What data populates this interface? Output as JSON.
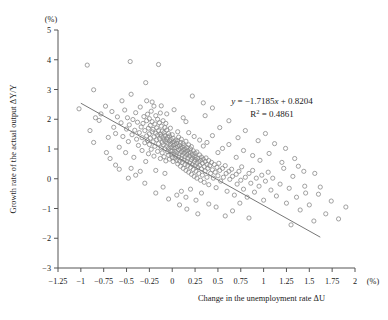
{
  "chart_data": {
    "type": "scatter",
    "title": "",
    "xlabel": "Change in the unemployment rate ΔU",
    "ylabel": "Growth rate of the actual output ΔY/Y",
    "x_unit": "(%)",
    "y_unit": "(%)",
    "xlim": [
      -1.25,
      2
    ],
    "ylim": [
      -3,
      5
    ],
    "x_ticks": [
      -1.25,
      -1,
      -0.75,
      -0.5,
      -0.25,
      0,
      0.25,
      0.5,
      0.75,
      1,
      1.25,
      1.5,
      1.75,
      2
    ],
    "x_tick_labels": [
      "−1.25",
      "−1",
      "−0.75",
      "−0.5",
      "−0.25",
      "0",
      "0.25",
      "0.5",
      "0.75",
      "1",
      "1.25",
      "1.5",
      "1.75",
      "2"
    ],
    "y_ticks": [
      -3,
      -2,
      -1,
      0,
      1,
      2,
      3,
      4,
      5
    ],
    "y_tick_labels": [
      "−3",
      "−2",
      "−1",
      "0",
      "1",
      "2",
      "3",
      "4",
      "5"
    ],
    "grid": false,
    "legend": "none",
    "marker": "open-circle",
    "marker_color": "#8a8a8a",
    "trendline": {
      "label": "y = −1.7185x + 0.8204",
      "r2_label": "R² = 0.4861",
      "slope": -1.7185,
      "intercept": 0.8204,
      "r_squared": 0.4861,
      "x_start": -1.0,
      "x_end": 1.62,
      "color": "#777777"
    },
    "annotations": [
      {
        "text_parts": {
          "lead": "y",
          "eq": " = −1.7185",
          "xvar": "x",
          "tail": " + 0.8204"
        },
        "x_px": 272,
        "y_px": 104
      },
      {
        "text_parts": {
          "base": "R",
          "sup": "2",
          "tail": " = 0.4861"
        },
        "x_px": 272,
        "y_px": 117
      }
    ],
    "points": [
      [
        -1.02,
        2.35
      ],
      [
        -0.93,
        3.82
      ],
      [
        -0.86,
        2.99
      ],
      [
        -0.84,
        2.05
      ],
      [
        -0.8,
        1.96
      ],
      [
        -0.78,
        2.18
      ],
      [
        -0.73,
        2.44
      ],
      [
        -0.7,
        1.39
      ],
      [
        -0.66,
        2.26
      ],
      [
        -0.64,
        1.73
      ],
      [
        -0.62,
        1.52
      ],
      [
        -0.6,
        2.08
      ],
      [
        -0.58,
        1.06
      ],
      [
        -0.56,
        1.88
      ],
      [
        -0.55,
        2.62
      ],
      [
        -0.54,
        1.42
      ],
      [
        -0.52,
        2.31
      ],
      [
        -0.51,
        0.88
      ],
      [
        -0.5,
        1.67
      ],
      [
        -0.49,
        2.05
      ],
      [
        -0.48,
        1.25
      ],
      [
        -0.47,
        1.81
      ],
      [
        -0.46,
        3.94
      ],
      [
        -0.45,
        2.84
      ],
      [
        -0.44,
        1.48
      ],
      [
        -0.43,
        1.99
      ],
      [
        -0.42,
        0.72
      ],
      [
        -0.41,
        1.63
      ],
      [
        -0.4,
        2.22
      ],
      [
        -0.39,
        1.33
      ],
      [
        -0.38,
        1.9
      ],
      [
        -0.37,
        1.12
      ],
      [
        -0.36,
        1.55
      ],
      [
        -0.35,
        2.41
      ],
      [
        -0.34,
        1.74
      ],
      [
        -0.33,
        0.95
      ],
      [
        -0.33,
        1.38
      ],
      [
        -0.32,
        1.86
      ],
      [
        -0.31,
        2.09
      ],
      [
        -0.3,
        1.21
      ],
      [
        -0.3,
        1.62
      ],
      [
        -0.29,
        3.23
      ],
      [
        -0.29,
        0.58
      ],
      [
        -0.28,
        1.44
      ],
      [
        -0.28,
        1.95
      ],
      [
        -0.27,
        1.28
      ],
      [
        -0.27,
        2.17
      ],
      [
        -0.26,
        1.7
      ],
      [
        -0.26,
        0.84
      ],
      [
        -0.25,
        1.51
      ],
      [
        -0.25,
        2.02
      ],
      [
        -0.25,
        1.15
      ],
      [
        -0.24,
        1.79
      ],
      [
        -0.24,
        1.36
      ],
      [
        -0.23,
        2.27
      ],
      [
        -0.23,
        0.99
      ],
      [
        -0.22,
        1.58
      ],
      [
        -0.22,
        1.92
      ],
      [
        -0.21,
        1.24
      ],
      [
        -0.21,
        1.66
      ],
      [
        -0.2,
        2.44
      ],
      [
        -0.2,
        0.76
      ],
      [
        -0.2,
        1.41
      ],
      [
        -0.19,
        1.84
      ],
      [
        -0.19,
        1.09
      ],
      [
        -0.18,
        1.53
      ],
      [
        -0.18,
        2.12
      ],
      [
        -0.17,
        1.31
      ],
      [
        -0.17,
        1.71
      ],
      [
        -0.16,
        0.92
      ],
      [
        -0.16,
        1.47
      ],
      [
        -0.16,
        2.0
      ],
      [
        -0.15,
        1.18
      ],
      [
        -0.15,
        1.62
      ],
      [
        -0.15,
        3.84
      ],
      [
        -0.14,
        1.35
      ],
      [
        -0.14,
        1.88
      ],
      [
        -0.13,
        0.68
      ],
      [
        -0.13,
        1.5
      ],
      [
        -0.13,
        2.21
      ],
      [
        -0.12,
        1.04
      ],
      [
        -0.12,
        1.43
      ],
      [
        -0.12,
        1.77
      ],
      [
        -0.11,
        1.22
      ],
      [
        -0.11,
        1.6
      ],
      [
        -0.11,
        0.87
      ],
      [
        -0.1,
        1.38
      ],
      [
        -0.1,
        1.95
      ],
      [
        -0.1,
        1.14
      ],
      [
        -0.09,
        1.55
      ],
      [
        -0.09,
        0.74
      ],
      [
        -0.09,
        1.3
      ],
      [
        -0.08,
        1.72
      ],
      [
        -0.08,
        1.01
      ],
      [
        -0.08,
        1.45
      ],
      [
        -0.07,
        1.25
      ],
      [
        -0.07,
        1.86
      ],
      [
        -0.07,
        0.6
      ],
      [
        -0.06,
        1.33
      ],
      [
        -0.06,
        1.08
      ],
      [
        -0.06,
        1.64
      ],
      [
        -0.05,
        0.91
      ],
      [
        -0.05,
        1.4
      ],
      [
        -0.05,
        1.19
      ],
      [
        -0.04,
        0.79
      ],
      [
        -0.04,
        1.52
      ],
      [
        -0.04,
        1.02
      ],
      [
        -0.03,
        1.27
      ],
      [
        -0.03,
        0.66
      ],
      [
        -0.03,
        1.44
      ],
      [
        -0.02,
        0.95
      ],
      [
        -0.02,
        1.16
      ],
      [
        -0.02,
        1.7
      ],
      [
        -0.01,
        0.82
      ],
      [
        -0.01,
        1.31
      ],
      [
        -0.01,
        1.05
      ],
      [
        0.0,
        0.71
      ],
      [
        0.0,
        1.22
      ],
      [
        0.0,
        1.48
      ],
      [
        0.0,
        0.93
      ],
      [
        0.01,
        1.12
      ],
      [
        0.01,
        0.58
      ],
      [
        0.01,
        1.36
      ],
      [
        0.02,
        0.84
      ],
      [
        0.02,
        1.03
      ],
      [
        0.02,
        1.25
      ],
      [
        0.03,
        0.69
      ],
      [
        0.03,
        1.15
      ],
      [
        0.03,
        0.92
      ],
      [
        0.04,
        1.3
      ],
      [
        0.04,
        0.77
      ],
      [
        0.04,
        1.05
      ],
      [
        0.05,
        0.62
      ],
      [
        0.05,
        1.19
      ],
      [
        0.05,
        0.88
      ],
      [
        0.06,
        1.08
      ],
      [
        0.06,
        0.5
      ],
      [
        0.06,
        1.27
      ],
      [
        0.07,
        0.73
      ],
      [
        0.07,
        0.97
      ],
      [
        0.07,
        1.4
      ],
      [
        0.08,
        0.59
      ],
      [
        0.08,
        1.12
      ],
      [
        0.08,
        0.84
      ],
      [
        0.09,
        1.02
      ],
      [
        0.09,
        0.42
      ],
      [
        0.09,
        1.22
      ],
      [
        0.1,
        0.68
      ],
      [
        0.1,
        0.91
      ],
      [
        0.1,
        1.33
      ],
      [
        0.11,
        0.55
      ],
      [
        0.11,
        1.06
      ],
      [
        0.11,
        0.79
      ],
      [
        0.12,
        0.97
      ],
      [
        0.12,
        0.35
      ],
      [
        0.12,
        1.18
      ],
      [
        0.13,
        0.63
      ],
      [
        0.13,
        0.86
      ],
      [
        0.13,
        1.11
      ],
      [
        0.14,
        0.48
      ],
      [
        0.14,
        1.0
      ],
      [
        0.14,
        0.74
      ],
      [
        0.15,
        0.92
      ],
      [
        0.15,
        1.26
      ],
      [
        0.15,
        0.28
      ],
      [
        0.16,
        0.58
      ],
      [
        0.16,
        0.81
      ],
      [
        0.16,
        1.05
      ],
      [
        0.17,
        0.44
      ],
      [
        0.17,
        0.95
      ],
      [
        0.17,
        0.69
      ],
      [
        0.18,
        0.86
      ],
      [
        0.18,
        0.22
      ],
      [
        0.18,
        1.14
      ],
      [
        0.19,
        0.53
      ],
      [
        0.19,
        0.76
      ],
      [
        0.2,
        1.0
      ],
      [
        0.2,
        0.38
      ],
      [
        0.2,
        0.89
      ],
      [
        0.21,
        0.64
      ],
      [
        0.21,
        0.15
      ],
      [
        0.21,
        1.08
      ],
      [
        0.22,
        0.48
      ],
      [
        0.22,
        0.81
      ],
      [
        0.22,
        0.7
      ],
      [
        0.23,
        0.31
      ],
      [
        0.23,
        0.94
      ],
      [
        0.24,
        0.58
      ],
      [
        0.24,
        0.76
      ],
      [
        0.24,
        0.08
      ],
      [
        0.25,
        0.44
      ],
      [
        0.25,
        0.86
      ],
      [
        0.25,
        0.65
      ],
      [
        0.26,
        0.25
      ],
      [
        0.26,
        0.72
      ],
      [
        0.27,
        0.52
      ],
      [
        0.27,
        0.02
      ],
      [
        0.27,
        0.9
      ],
      [
        0.28,
        0.38
      ],
      [
        0.28,
        0.68
      ],
      [
        0.29,
        0.58
      ],
      [
        0.29,
        0.18
      ],
      [
        0.3,
        0.8
      ],
      [
        0.3,
        0.45
      ],
      [
        0.31,
        0.62
      ],
      [
        0.31,
        -0.05
      ],
      [
        0.32,
        0.33
      ],
      [
        0.32,
        0.73
      ],
      [
        0.33,
        0.52
      ],
      [
        0.33,
        0.12
      ],
      [
        0.34,
        0.66
      ],
      [
        0.35,
        0.41
      ],
      [
        0.35,
        -0.12
      ],
      [
        0.36,
        0.58
      ],
      [
        0.36,
        0.26
      ],
      [
        0.37,
        0.7
      ],
      [
        0.38,
        0.48
      ],
      [
        0.38,
        0.05
      ],
      [
        0.39,
        0.35
      ],
      [
        0.4,
        0.61
      ],
      [
        0.4,
        -0.2
      ],
      [
        0.41,
        0.44
      ],
      [
        0.42,
        0.18
      ],
      [
        0.43,
        0.55
      ],
      [
        0.44,
        0.3
      ],
      [
        0.45,
        0.02
      ],
      [
        0.46,
        0.48
      ],
      [
        0.47,
        0.22
      ],
      [
        0.48,
        -0.3
      ],
      [
        0.49,
        0.38
      ],
      [
        0.5,
        0.1
      ],
      [
        0.51,
        0.52
      ],
      [
        0.52,
        0.28
      ],
      [
        0.53,
        -0.08
      ],
      [
        0.55,
        0.35
      ],
      [
        0.56,
        0.05
      ],
      [
        0.58,
        0.44
      ],
      [
        0.59,
        0.18
      ],
      [
        0.6,
        -0.42
      ],
      [
        0.62,
        0.25
      ],
      [
        0.63,
        -0.02
      ],
      [
        0.65,
        0.32
      ],
      [
        0.66,
        0.08
      ],
      [
        0.68,
        -0.55
      ],
      [
        0.7,
        0.15
      ],
      [
        0.71,
        -0.18
      ],
      [
        0.73,
        0.25
      ],
      [
        0.75,
        -0.05
      ],
      [
        0.76,
        0.4
      ],
      [
        0.78,
        -0.35
      ],
      [
        0.8,
        0.05
      ],
      [
        0.82,
        -0.62
      ],
      [
        0.84,
        0.18
      ],
      [
        0.86,
        -0.15
      ],
      [
        0.88,
        0.28
      ],
      [
        0.9,
        -0.45
      ],
      [
        0.92,
        0.02
      ],
      [
        0.95,
        -0.25
      ],
      [
        0.98,
        0.12
      ],
      [
        1.0,
        -0.72
      ],
      [
        1.02,
        -0.08
      ],
      [
        1.05,
        0.22
      ],
      [
        1.08,
        -0.38
      ],
      [
        1.1,
        0.02
      ],
      [
        1.14,
        -0.58
      ],
      [
        1.18,
        -0.18
      ],
      [
        1.22,
        0.35
      ],
      [
        1.25,
        -0.82
      ],
      [
        1.28,
        -0.32
      ],
      [
        1.32,
        0.08
      ],
      [
        1.36,
        -0.62
      ],
      [
        1.4,
        -1.05
      ],
      [
        1.45,
        -0.25
      ],
      [
        1.5,
        -0.88
      ],
      [
        1.55,
        -1.42
      ],
      [
        1.6,
        -0.52
      ],
      [
        1.68,
        -1.18
      ],
      [
        1.74,
        -0.75
      ],
      [
        1.82,
        -1.35
      ],
      [
        1.9,
        -0.95
      ],
      [
        -0.86,
        1.22
      ],
      [
        -0.62,
        0.46
      ],
      [
        -0.45,
        0.35
      ],
      [
        -0.35,
        0.25
      ],
      [
        -0.28,
        2.62
      ],
      [
        -0.22,
        2.58
      ],
      [
        -0.18,
        0.28
      ],
      [
        -0.12,
        2.45
      ],
      [
        -0.08,
        0.18
      ],
      [
        0.02,
        2.32
      ],
      [
        0.06,
        1.58
      ],
      [
        0.12,
        2.05
      ],
      [
        0.18,
        1.55
      ],
      [
        0.24,
        1.42
      ],
      [
        0.3,
        1.3
      ],
      [
        0.34,
        1.1
      ],
      [
        0.38,
        1.22
      ],
      [
        0.44,
        1.45
      ],
      [
        0.5,
        0.88
      ],
      [
        0.55,
        1.02
      ],
      [
        0.62,
        1.15
      ],
      [
        0.7,
        0.72
      ],
      [
        0.78,
        0.95
      ],
      [
        0.88,
        0.78
      ],
      [
        0.96,
        0.62
      ],
      [
        1.06,
        0.85
      ],
      [
        1.2,
        0.55
      ],
      [
        1.34,
        0.68
      ],
      [
        0.05,
        -0.55
      ],
      [
        0.1,
        -0.42
      ],
      [
        0.15,
        -0.62
      ],
      [
        0.2,
        -0.35
      ],
      [
        0.26,
        -0.72
      ],
      [
        0.32,
        -0.48
      ],
      [
        0.4,
        -0.85
      ],
      [
        0.16,
        -1.02
      ],
      [
        0.28,
        -1.18
      ],
      [
        0.48,
        -0.95
      ],
      [
        0.58,
        -1.25
      ],
      [
        0.08,
        -0.88
      ],
      [
        -0.1,
        -0.28
      ],
      [
        -0.18,
        -0.48
      ],
      [
        -0.04,
        -0.68
      ],
      [
        -0.3,
        -0.15
      ],
      [
        -0.4,
        0.12
      ],
      [
        -0.48,
        0.02
      ],
      [
        0.66,
        -1.08
      ],
      [
        0.74,
        -0.82
      ],
      [
        0.84,
        -1.32
      ],
      [
        1.44,
        0.25
      ],
      [
        1.3,
        -1.55
      ],
      [
        0.36,
        2.12
      ],
      [
        0.44,
        2.38
      ],
      [
        0.52,
        1.72
      ],
      [
        0.62,
        1.95
      ],
      [
        0.72,
        1.38
      ],
      [
        0.8,
        1.62
      ],
      [
        0.94,
        1.28
      ],
      [
        1.02,
        1.52
      ],
      [
        1.12,
        1.18
      ],
      [
        1.24,
        1.02
      ],
      [
        -0.68,
        0.68
      ],
      [
        -0.58,
        0.32
      ],
      [
        -0.72,
        0.88
      ],
      [
        -0.9,
        1.62
      ],
      [
        0.22,
        2.78
      ],
      [
        0.34,
        2.55
      ],
      [
        0.15,
        1.92
      ],
      [
        -0.06,
        2.18
      ],
      [
        1.38,
        0.42
      ],
      [
        1.56,
        0.18
      ],
      [
        1.46,
        -0.48
      ],
      [
        1.62,
        -0.28
      ]
    ]
  }
}
